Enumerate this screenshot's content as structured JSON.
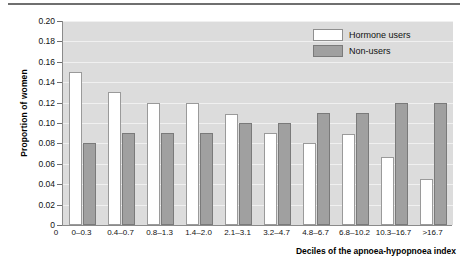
{
  "chart_data": {
    "type": "bar",
    "title": "",
    "xlabel": "Deciles of the apnoea-hypopnoea index",
    "ylabel": "Proportion of women",
    "categories": [
      "0–0.3",
      "0.4–0.7",
      "0.8–1.3",
      "1.4–2.0",
      "2.1–3.1",
      "3.2–4.7",
      "4.8–6.7",
      "6.8–10.2",
      "10.3–16.7",
      ">16.7"
    ],
    "series": [
      {
        "name": "Hormone users",
        "color": "#ffffff",
        "values": [
          0.15,
          0.13,
          0.12,
          0.12,
          0.109,
          0.09,
          0.08,
          0.089,
          0.067,
          0.045
        ]
      },
      {
        "name": "Non-users",
        "color": "#a0a0a0",
        "values": [
          0.08,
          0.09,
          0.09,
          0.09,
          0.1,
          0.1,
          0.11,
          0.11,
          0.12,
          0.12
        ]
      }
    ],
    "ylim": [
      0,
      0.2
    ],
    "yticks": [
      0.0,
      0.02,
      0.04,
      0.06,
      0.08,
      0.1,
      0.12,
      0.14,
      0.16,
      0.18,
      0.2
    ],
    "ytick_labels": [
      "0",
      "0.02",
      "0.04",
      "0.06",
      "0.08",
      "0.10",
      "0.12",
      "0.14",
      "0.16",
      "0.18",
      "0.20"
    ],
    "origin_label": "0",
    "grid": true,
    "legend_position": "top-right"
  },
  "legend": {
    "items": [
      {
        "label": "Hormone users",
        "style": "open"
      },
      {
        "label": "Non-users",
        "style": "filled"
      }
    ]
  }
}
